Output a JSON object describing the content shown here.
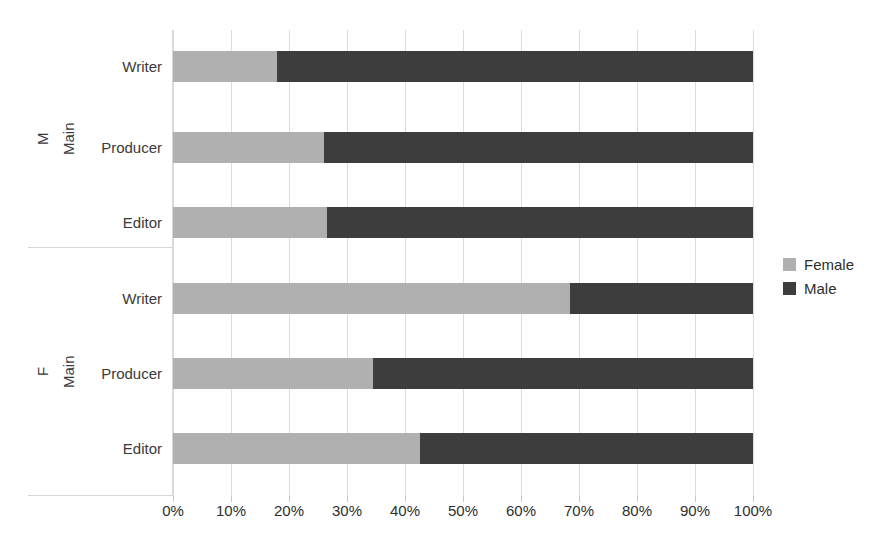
{
  "chart_data": {
    "type": "bar",
    "orientation": "horizontal",
    "stacked": true,
    "normalized": true,
    "title": "",
    "xlabel": "",
    "ylabel": "",
    "xlim": [
      0,
      100
    ],
    "xticks": [
      "0%",
      "10%",
      "20%",
      "30%",
      "40%",
      "50%",
      "60%",
      "70%",
      "80%",
      "90%",
      "100%"
    ],
    "xtick_values": [
      0,
      10,
      20,
      30,
      40,
      50,
      60,
      70,
      80,
      90,
      100
    ],
    "grid": true,
    "grid_axis": "x",
    "legend_position": "right",
    "series": [
      {
        "name": "Female",
        "color": "#b0b0b0",
        "values": [
          18,
          26,
          26.5,
          68.5,
          34.5,
          42.5
        ]
      },
      {
        "name": "Male",
        "color": "#3d3d3d",
        "values": [
          82,
          74,
          73.5,
          31.5,
          65.5,
          57.5
        ]
      }
    ],
    "categories": [
      "Writer",
      "Producer",
      "Editor",
      "Writer",
      "Producer",
      "Editor"
    ],
    "groups": [
      {
        "outer_label": "M",
        "inner_label": "Main",
        "rows": [
          {
            "label": "Writer",
            "female": 18,
            "male": 82
          },
          {
            "label": "Producer",
            "female": 26,
            "male": 74
          },
          {
            "label": "Editor",
            "female": 26.5,
            "male": 73.5
          }
        ]
      },
      {
        "outer_label": "F",
        "inner_label": "Main",
        "rows": [
          {
            "label": "Writer",
            "female": 68.5,
            "male": 31.5
          },
          {
            "label": "Producer",
            "female": 34.5,
            "male": 65.5
          },
          {
            "label": "Editor",
            "female": 42.5,
            "male": 57.5
          }
        ]
      }
    ]
  },
  "legend": {
    "items": [
      {
        "label": "Female",
        "color": "#b0b0b0"
      },
      {
        "label": "Male",
        "color": "#3d3d3d"
      }
    ]
  },
  "axis": {
    "group_top": {
      "outer": "M",
      "inner": "Main"
    },
    "group_bottom": {
      "outer": "F",
      "inner": "Main"
    },
    "rows_top": [
      "Writer",
      "Producer",
      "Editor"
    ],
    "rows_bottom": [
      "Writer",
      "Producer",
      "Editor"
    ]
  }
}
